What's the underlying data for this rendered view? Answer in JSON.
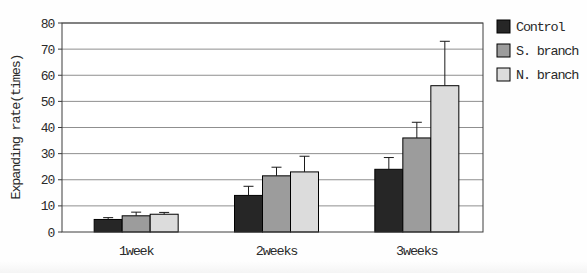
{
  "chart_data": {
    "type": "bar",
    "title": "",
    "xlabel": "",
    "ylabel": "Expanding rate(times)",
    "categories": [
      "1week",
      "2weeks",
      "3weeks"
    ],
    "series": [
      {
        "name": "Control",
        "color": "#262626",
        "values": [
          4.8,
          14.0,
          24.0
        ],
        "errors_plus": [
          0.7,
          3.5,
          4.5
        ]
      },
      {
        "name": "S. branch",
        "color": "#9c9c9c",
        "values": [
          6.2,
          21.5,
          36.0
        ],
        "errors_plus": [
          1.4,
          3.3,
          6.0
        ]
      },
      {
        "name": "N. branch",
        "color": "#dcdcdc",
        "values": [
          6.8,
          23.0,
          56.0
        ],
        "errors_plus": [
          0.7,
          6.0,
          17.0
        ]
      }
    ],
    "ylim": [
      0,
      80
    ],
    "yticks": [
      0,
      10,
      20,
      30,
      40,
      50,
      60,
      70,
      80
    ],
    "grid": true,
    "grid_orientation": "horizontal",
    "error_bars": "upper-with-cap",
    "legend_position": "top-right-outside",
    "style": {
      "background": "#fefefe",
      "plot_background": "#ffffff",
      "grid_color": "#8f8f8f",
      "border_color": "#3c3c3c",
      "bar_outline_color": "#000000",
      "error_bar_color": "#1a1a1a",
      "text_color": "#2a2a2a"
    }
  }
}
